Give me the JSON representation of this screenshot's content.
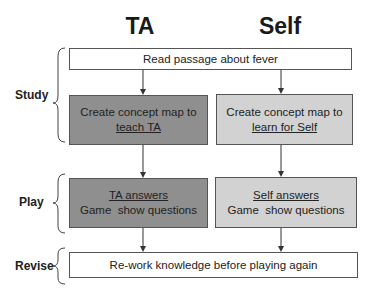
{
  "columns": {
    "ta": "TA",
    "self": "Self"
  },
  "phases": {
    "study": "Study",
    "play": "Play",
    "revise": "Revise"
  },
  "boxes": {
    "read_passage": "Read passage about fever",
    "ta_study": {
      "line1": "Create concept map to",
      "line2": "teach TA"
    },
    "self_study": {
      "line1": "Create concept map to",
      "line2": "learn for Self"
    },
    "ta_play": {
      "line1": "TA answers",
      "line2": "Game  show questions"
    },
    "self_play": {
      "line1": "Self answers",
      "line2": "Game  show questions"
    },
    "revise": "Re-work knowledge before playing again"
  },
  "colors": {
    "ta_fill": "#8f8f8f",
    "self_fill": "#d2d2d2",
    "shared_fill": "#ffffff",
    "stroke": "#555555"
  }
}
